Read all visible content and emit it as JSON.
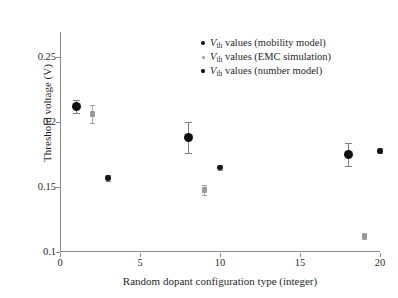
{
  "chart_data": {
    "type": "scatter",
    "title": "",
    "xlabel": "Random dopant configuration type (integer)",
    "ylabel": "Threshold voltage (V)",
    "xlim": [
      0,
      20
    ],
    "ylim": [
      0.1,
      0.2695
    ],
    "xticks": [
      0,
      5,
      10,
      15,
      20
    ],
    "xtick_labels": [
      "0",
      "5",
      "10",
      "15",
      "20"
    ],
    "yticks": [
      0.1,
      0.15,
      0.2,
      0.25
    ],
    "ytick_labels": [
      "0.1",
      "0.15",
      "0.2",
      "0.25"
    ],
    "grid": false,
    "legend_position": "upper right",
    "series": [
      {
        "name": "V_th values (mobility model)",
        "marker": "large-filled-circle",
        "color": "#111111",
        "points": [
          {
            "x": 1,
            "y": 0.212,
            "yerr": 0.005
          },
          {
            "x": 8,
            "y": 0.188,
            "yerr": 0.012
          },
          {
            "x": 18,
            "y": 0.175,
            "yerr": 0.009
          }
        ]
      },
      {
        "name": "V_th values (EMC simulation)",
        "marker": "small-gray-square",
        "color": "#9a9a9a",
        "points": [
          {
            "x": 2,
            "y": 0.206,
            "yerr": 0.007
          },
          {
            "x": 9,
            "y": 0.148,
            "yerr": 0.004
          },
          {
            "x": 19,
            "y": 0.112,
            "yerr": 0.002
          }
        ]
      },
      {
        "name": "V_th values (number model)",
        "marker": "small-filled-circle",
        "color": "#161616",
        "points": [
          {
            "x": 3,
            "y": 0.157,
            "yerr": 0.002
          },
          {
            "x": 10,
            "y": 0.165,
            "yerr": 0.002
          },
          {
            "x": 20,
            "y": 0.178,
            "yerr": 0.002
          }
        ]
      }
    ]
  },
  "axes": {
    "x_title": "Random dopant configuration type (integer)",
    "y_title": "Threshold voltage (V)",
    "x_tick_labels": [
      "0",
      "5",
      "10",
      "15",
      "20"
    ],
    "y_tick_labels": [
      "0.1",
      "0.15",
      "0.2",
      "0.25"
    ]
  },
  "legend": {
    "entries": [
      {
        "prefix": "V",
        "subscript": "th",
        "suffix": " values (mobility model)",
        "marker": "large-filled-circle",
        "color": "#111111"
      },
      {
        "prefix": "V",
        "subscript": "th",
        "suffix": " values (EMC simulation)",
        "marker": "small-gray-circle",
        "color": "#9a9a9a"
      },
      {
        "prefix": "V",
        "subscript": "th",
        "suffix": " values (number model)",
        "marker": "small-filled-circle",
        "color": "#161616"
      }
    ]
  },
  "style": {
    "axis_color": "#8a8a8a",
    "text_color": "#1f1f1f",
    "background": "#ffffff"
  }
}
